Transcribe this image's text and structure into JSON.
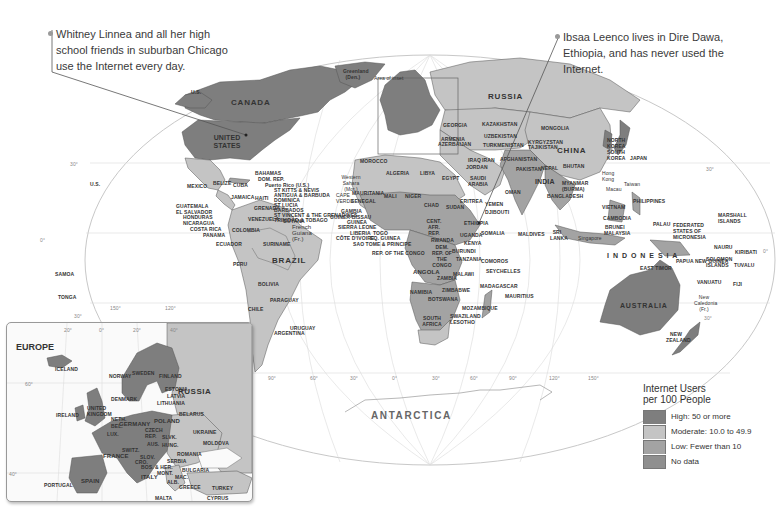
{
  "callouts": {
    "left": {
      "lines": [
        "Whitney Linnea and all her high",
        "school friends in suburban Chicago",
        "use the Internet every day."
      ]
    },
    "right": {
      "lines": [
        "Ibsaa Leenco lives in Dire Dawa,",
        "Ethiopia, and has never used the",
        "Internet."
      ]
    }
  },
  "legend": {
    "title_line1": "Internet Users",
    "title_line2": "per 100 People",
    "items": [
      {
        "label": "High: 50 or more",
        "color": "#7e7e7e"
      },
      {
        "label": "Moderate: 10.0 to 49.9",
        "color": "#c4c4c4"
      },
      {
        "label": "Low: Fewer than 10",
        "color": "#a3a3a3"
      },
      {
        "label": "No data",
        "color": "#8f8f8f"
      }
    ]
  },
  "colors": {
    "high": "#7e7e7e",
    "moderate": "#c4c4c4",
    "low": "#a3a3a3",
    "nodata": "#8f8f8f",
    "ocean": "#ffffff",
    "graticule": "#cfcfcf"
  },
  "map": {
    "area_of_inset": "Area of inset",
    "antarctica": "ANTARCTICA",
    "graticule_labels": {
      "lat_30n_right": "30°",
      "lat_30n_left": "30°",
      "lat_0_left": "0°",
      "lat_0_right": "0°",
      "lat_30s_left": "30°",
      "lat_30s_right": "30°",
      "lon": [
        "150°",
        "120°",
        "90°",
        "60°",
        "30°",
        "0°",
        "30°",
        "60°",
        "90°",
        "120°",
        "150°"
      ]
    },
    "countries_large": {
      "canada": "CANADA",
      "us": "UNITED STATES",
      "russia": "RUSSIA",
      "china": "CHINA",
      "brazil": "BRAZIL",
      "australia": "AUSTRALIA",
      "india": "INDIA",
      "indonesia": "I N D O N E S I A"
    },
    "countries_small": {
      "greenland": "Greenland (Den.)",
      "us_hawaii": "U.S.",
      "us_alaska": "U.S.",
      "mexico": "MEXICO",
      "belize": "BELIZE",
      "cuba": "CUBA",
      "bahamas": "BAHAMAS",
      "dom_rep": "DOM. REP.",
      "puerto_rico": "Puerto Rico (U.S.)",
      "st_kitts": "ST KITTS & NEVIS",
      "antigua": "ANTIGUA & BARBUDA",
      "dominica": "DOMINICA",
      "st_lucia": "ST LUCIA",
      "barbados": "BARBADOS",
      "st_vincent": "ST VINCENT & THE GRENADINES",
      "trinidad": "TRINIDAD & TOBAGO",
      "grenada": "GRENADA",
      "jamaica": "JAMAICA",
      "haiti": "HAITI",
      "guatemala": "GUATEMALA",
      "el_salvador": "EL SALVADOR",
      "honduras": "HONDURAS",
      "nicaragua": "NICARAGUA",
      "costa_rica": "COSTA RICA",
      "panama": "PANAMA",
      "venezuela": "VENEZUELA",
      "guyana": "GUYANA",
      "french_guiana": "French Guiana (Fr.)",
      "colombia": "COLOMBIA",
      "suriname": "SURINAME",
      "ecuador": "ECUADOR",
      "peru": "PERU",
      "bolivia": "BOLIVIA",
      "paraguay": "PARAGUAY",
      "chile": "CHILE",
      "argentina": "ARGENTINA",
      "uruguay": "URUGUAY",
      "samoa": "SAMOA",
      "tonga": "TONGA",
      "morocco": "MOROCCO",
      "western_sahara": "Western Sahara (Mor.)",
      "algeria": "ALGERIA",
      "libya": "LIBYA",
      "egypt": "EGYPT",
      "mauritania": "MAURITANIA",
      "mali": "MALI",
      "niger": "NIGER",
      "chad": "CHAD",
      "sudan": "SUDAN",
      "cape_verde": "CAPE VERDE",
      "senegal": "SENEGAL",
      "gambia": "GAMBIA",
      "guinea_bissau": "GUINEA-BISSAU",
      "guinea": "GUINEA",
      "sierra_leone": "SIERRA LEONE",
      "liberia": "LIBERIA",
      "cote_divoire": "CÔTE D'IVOIRE",
      "togo": "TOGO",
      "eq_guinea": "EQ. GUINEA",
      "sao_tome": "SAO TOME & PRINCIPE",
      "rep_congo": "REP. OF THE CONGO",
      "car": "CENT. AFR. REP.",
      "ethiopia": "ETHIOPIA",
      "eritrea": "ERITREA",
      "djibouti": "DJIBOUTI",
      "somalia": "SOMALIA",
      "yemen": "YEMEN",
      "oman": "OMAN",
      "saudi_arabia": "SAUDI ARABIA",
      "uganda": "UGANDA",
      "kenya": "KENYA",
      "rwanda": "RWANDA",
      "burundi": "BURUNDI",
      "dem_rep_congo": "DEM. REP. OF THE CONGO",
      "tanzania": "TANZANIA",
      "angola": "ANGOLA",
      "zambia": "ZAMBIA",
      "malawi": "MALAWI",
      "namibia": "NAMIBIA",
      "botswana": "BOTSWANA",
      "zimbabwe": "ZIMBABWE",
      "mozambique": "MOZAMBIQUE",
      "south_africa": "SOUTH AFRICA",
      "swaziland": "SWAZILAND",
      "lesotho": "LESOTHO",
      "madagascar": "MADAGASCAR",
      "comoros": "COMOROS",
      "seychelles": "SEYCHELLES",
      "mauritius": "MAURITIUS",
      "maldives": "MALDIVES",
      "sri_lanka": "SRI LANKA",
      "kazakhstan": "KAZAKHSTAN",
      "mongolia": "MONGOLIA",
      "georgia": "GEORGIA",
      "armenia": "ARMENIA",
      "azerbaijan": "AZERBAIJAN",
      "uzbekistan": "UZBEKISTAN",
      "turkmenistan": "TURKMENISTAN",
      "kyrgyzstan": "KYRGYZSTAN",
      "tajikistan": "TAJIKISTAN",
      "iran": "IRAN",
      "iraq": "IRAQ",
      "afghanistan": "AFGHANISTAN",
      "pakistan": "PAKISTAN",
      "nepal": "NEPAL",
      "bhutan": "BHUTAN",
      "bangladesh": "BANGLADESH",
      "myanmar": "MYANMAR (BURMA)",
      "jordan": "JORDAN",
      "north_korea": "NORTH KOREA",
      "south_korea": "SOUTH KOREA",
      "japan": "JAPAN",
      "hong_kong": "Hong Kong",
      "macau": "Macau",
      "taiwan": "Taiwan",
      "vietnam": "VIETNAM",
      "philippines": "PHILIPPINES",
      "cambodia": "CAMBODIA",
      "palau": "PALAU",
      "brunei": "BRUNEI",
      "malaysia": "MALAYSIA",
      "singapore": "Singapore",
      "micronesia": "FEDERATED STATES OF MICRONESIA",
      "marshall_islands": "MARSHALL ISLANDS",
      "nauru": "NAURU",
      "kiribati": "KIRIBATI",
      "png": "PAPUA NEW GUINEA",
      "solomon_islands": "SOLOMON ISLANDS",
      "tuvalu": "TUVALU",
      "east_timor": "EAST TIMOR",
      "vanuatu": "VANUATU",
      "fiji": "FIJI",
      "new_caledonia": "New Caledonia (Fr.)",
      "new_zealand": "NEW ZEALAND"
    }
  },
  "inset": {
    "title": "EUROPE",
    "lon_labels": [
      "20°",
      "0°",
      "20°",
      "40°"
    ],
    "lat_labels": [
      "60°",
      "40°"
    ],
    "countries": {
      "iceland": "ICELAND",
      "norway": "NORWAY",
      "sweden": "SWEDEN",
      "finland": "FINLAND",
      "russia": "RUSSIA",
      "estonia": "ESTONIA",
      "latvia": "LATVIA",
      "lithuania": "LITHUANIA",
      "denmark": "DENMARK",
      "uk": "UNITED KINGDOM",
      "ireland": "IRELAND",
      "neth": "NETH.",
      "belarus": "BELARUS",
      "bel": "BEL.",
      "germany": "GERMANY",
      "poland": "POLAND",
      "lux": "LUX.",
      "czech": "CZECH REP.",
      "slovakia": "SLVK.",
      "ukraine": "UKRAINE",
      "aus": "AUS.",
      "hung": "HUNG.",
      "moldova": "MOLDOVA",
      "switz": "SWITZ.",
      "france": "FRANCE",
      "romania": "ROMANIA",
      "slov": "SLOV.",
      "croatia": "CRO.",
      "serbia": "SERBIA",
      "bosnia": "BOS. & HER.",
      "mont": "MONT.",
      "bulgaria": "BULGARIA",
      "mac": "MAC.",
      "italy": "ITALY",
      "alb": "ALB.",
      "spain": "SPAIN",
      "portugal": "PORTUGAL",
      "greece": "GREECE",
      "turkey": "TURKEY",
      "malta": "MALTA",
      "cyprus": "CYPRUS"
    }
  }
}
